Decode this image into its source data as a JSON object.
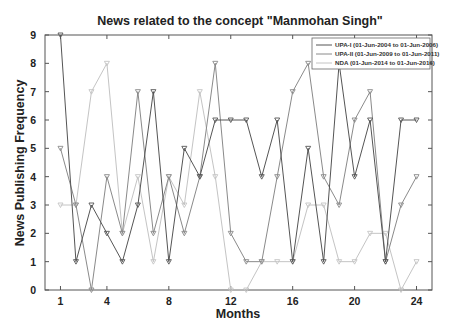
{
  "chart_data": {
    "type": "line",
    "title": "News related to the concept \"Manmohan Singh\"",
    "xlabel": "Months",
    "ylabel": "News Publishing  Frequency",
    "x": [
      1,
      2,
      3,
      4,
      5,
      6,
      7,
      8,
      9,
      10,
      11,
      12,
      13,
      14,
      15,
      16,
      17,
      18,
      19,
      20,
      21,
      22,
      23,
      24
    ],
    "xticks": [
      1,
      4,
      8,
      12,
      16,
      20,
      24
    ],
    "yticks": [
      0,
      1,
      2,
      3,
      4,
      5,
      6,
      7,
      8,
      9
    ],
    "xlim": [
      0,
      25
    ],
    "ylim": [
      0,
      9
    ],
    "grid": false,
    "legend_position": "upper right",
    "series": [
      {
        "name": "UPA-I (01-Jun-2004 to 01-Jun-2006)",
        "color": "#555555",
        "values": [
          9,
          1,
          3,
          2,
          1,
          3,
          7,
          1,
          5,
          4,
          6,
          6,
          6,
          4,
          6,
          1,
          5,
          1,
          8,
          4,
          6,
          1,
          6,
          6
        ]
      },
      {
        "name": "UPA-II (01-Jun-2009 to 01-Jun-2011)",
        "color": "#8a8a8a",
        "values": [
          5,
          3,
          0,
          4,
          2,
          7,
          2,
          4,
          2,
          4,
          8,
          2,
          1,
          1,
          4,
          7,
          8,
          4,
          3,
          6,
          7,
          1,
          3,
          4
        ]
      },
      {
        "name": "NDA (01-Jun-2014 to 01-Jun-2016)",
        "color": "#c4c4c4",
        "values": [
          3,
          3,
          7,
          8,
          2,
          4,
          1,
          4,
          3,
          7,
          4,
          0,
          0,
          1,
          1,
          1,
          3,
          3,
          1,
          1,
          2,
          2,
          0,
          1
        ]
      }
    ]
  }
}
